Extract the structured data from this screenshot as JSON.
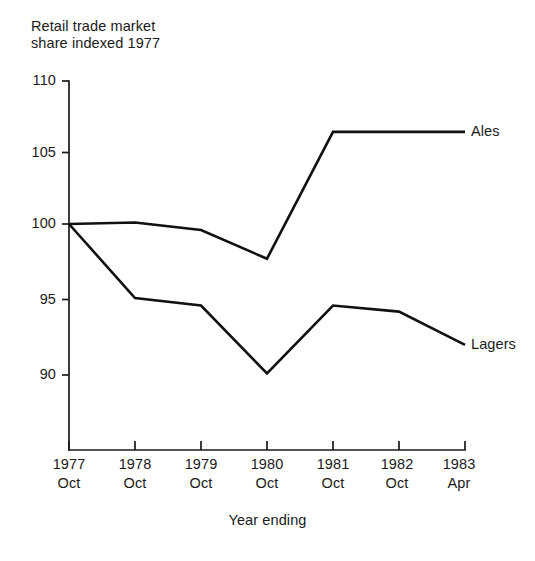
{
  "chart_data": {
    "type": "line",
    "title_line1": "Retail trade market",
    "title_line2": "share indexed 1977",
    "xlabel": "Year ending",
    "ylabel": "",
    "grid": false,
    "legend_position": "right-inline-labels",
    "ylim": [
      85,
      110
    ],
    "yticks": [
      110,
      105,
      100,
      95,
      90
    ],
    "ytick_labels": [
      "110",
      "105",
      "100",
      "95",
      "90"
    ],
    "categories": [
      "1977 Oct",
      "1978 Oct",
      "1979 Oct",
      "1980 Oct",
      "1981 Oct",
      "1982 Oct",
      "1983 Apr"
    ],
    "xtick_years": [
      "1977",
      "1978",
      "1979",
      "1980",
      "1981",
      "1982",
      "1983"
    ],
    "xtick_months": [
      "Oct",
      "Oct",
      "Oct",
      "Oct",
      "Oct",
      "Oct",
      "Apr"
    ],
    "series": [
      {
        "name": "Ales",
        "values": [
          100.0,
          100.1,
          99.6,
          97.7,
          106.1,
          106.1,
          106.1
        ],
        "color": "#111111"
      },
      {
        "name": "Lagers",
        "values": [
          100.0,
          95.1,
          94.6,
          90.1,
          94.6,
          94.2,
          92.0
        ],
        "color": "#111111"
      }
    ],
    "annotations": [
      {
        "text": "Ales",
        "series": "Ales"
      },
      {
        "text": "Lagers",
        "series": "Lagers"
      }
    ]
  },
  "axis": {
    "y_ticks": [
      {
        "label": "110"
      },
      {
        "label": "105"
      },
      {
        "label": "100"
      },
      {
        "label": "95"
      },
      {
        "label": "90"
      }
    ],
    "x_ticks": [
      {
        "year": "1977",
        "month": "Oct"
      },
      {
        "year": "1978",
        "month": "Oct"
      },
      {
        "year": "1979",
        "month": "Oct"
      },
      {
        "year": "1980",
        "month": "Oct"
      },
      {
        "year": "1981",
        "month": "Oct"
      },
      {
        "year": "1982",
        "month": "Oct"
      },
      {
        "year": "1983",
        "month": "Apr"
      }
    ],
    "x_axis_title": "Year ending"
  },
  "labels": {
    "ales": "Ales",
    "lagers": "Lagers"
  }
}
